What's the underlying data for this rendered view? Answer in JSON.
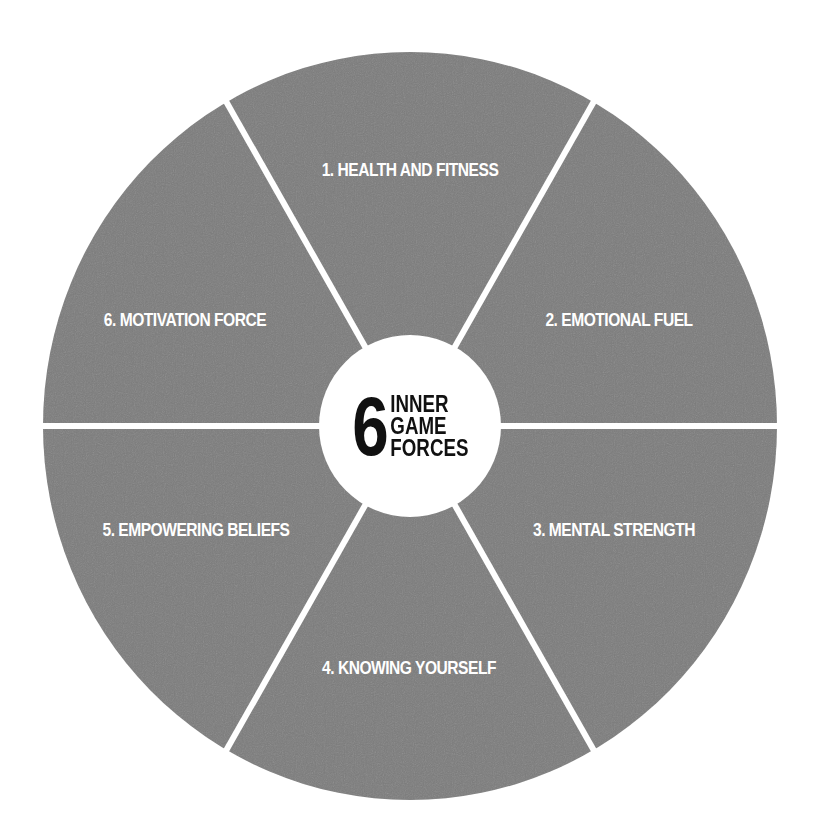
{
  "diagram": {
    "type": "wheel",
    "center_label": {
      "number": "6",
      "words": [
        "INNER",
        "GAME",
        "FORCES"
      ]
    },
    "segments": [
      {
        "label": "1. HEALTH AND FITNESS",
        "position": "top"
      },
      {
        "label": "2. EMOTIONAL FUEL",
        "position": "upper-right"
      },
      {
        "label": "3. MENTAL STRENGTH",
        "position": "lower-right"
      },
      {
        "label": "4. KNOWING YOURSELF",
        "position": "bottom"
      },
      {
        "label": "5. EMPOWERING BELIEFS",
        "position": "lower-left"
      },
      {
        "label": "6. MOTIVATION FORCE",
        "position": "upper-left"
      }
    ],
    "colors": {
      "segment_fill": "#7b7b7b",
      "divider": "#ffffff",
      "hub_fill": "#ffffff",
      "hub_text": "#111111",
      "segment_text": "#ffffff",
      "background": "#ffffff"
    }
  }
}
